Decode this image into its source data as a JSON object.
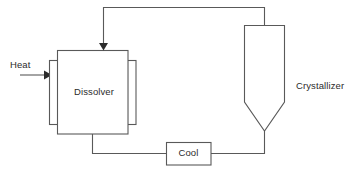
{
  "diagram": {
    "type": "process-flow-diagram",
    "background_color": "#ffffff",
    "line_color": "#595959",
    "text_color": "#2b2b2b",
    "canvas": {
      "width": 355,
      "height": 172
    }
  },
  "nodes": {
    "dissolver": {
      "label": "Dissolver",
      "shape": "jacketed-rectangle",
      "x": 57,
      "y": 50,
      "width": 71,
      "height": 84,
      "jacket_left": {
        "x": 49,
        "y": 60,
        "width": 9,
        "height": 64
      },
      "jacket_right": {
        "x": 127,
        "y": 60,
        "width": 9,
        "height": 64
      }
    },
    "crystallizer": {
      "label": "Crystallizer",
      "shape": "vessel-with-conical-bottom",
      "x": 244,
      "y": 25,
      "width": 41,
      "body_height": 77,
      "cone_apex_y": 131,
      "label_x": 296,
      "label_y": 81
    },
    "cool": {
      "label": "Cool",
      "shape": "rectangle",
      "x": 166,
      "y": 142,
      "width": 45,
      "height": 23
    }
  },
  "streams": {
    "heat_inlet": {
      "label": "Heat",
      "has_arrow": true,
      "direction": "right",
      "from_x": 20,
      "to_x": 49,
      "y": 75
    },
    "recycle_overhead": {
      "label": "",
      "has_arrow": true,
      "direction": "down-into-dissolver",
      "path": "from crystallizer top up to y=7, left to x=103, down to dissolver top y=50"
    },
    "dissolver_to_cool": {
      "label": "",
      "has_arrow": false,
      "path": "from dissolver bottom x=92 down to y=153, right to cool box left edge x=166"
    },
    "cool_to_crystallizer": {
      "label": "",
      "has_arrow": false,
      "path": "from cool box right edge x=211 right to x=265, up to crystallizer cone apex y=131"
    }
  },
  "labels": {
    "heat": "Heat",
    "dissolver": "Dissolver",
    "cool": "Cool",
    "crystallizer": "Crystallizer"
  }
}
